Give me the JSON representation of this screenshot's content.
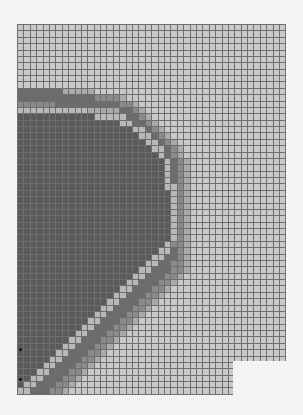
{
  "grid": {
    "left": 17,
    "top": 24,
    "cols": 42,
    "rows": 58,
    "cell_w": 6.4,
    "cell_h": 6.38,
    "palette": {
      "0": "#c9c9c9",
      "1": "#aaaaaa",
      "2": "#8a8a8a",
      "3": "#6b6b6b",
      "4": "#5a5a5a",
      "5": "#b8b8b8"
    },
    "line_color": "#6e6e6e",
    "rows_data": [
      "000000000000000000000000000000000000000000",
      "000000000000000000000000000000000000000000",
      "000000000000000000000000000000000000000000",
      "000000000000000000000000000000000000000000",
      "000000000000000000000000000000000000000000",
      "000000000000000000000000000000000000000000",
      "000000000000000000000000000000000000000000",
      "000000000000000000000000000000000000000000",
      "000000000000000000000000000000000000000000",
      "000000000000000000000000000000000000000000",
      "333333311111000000000000000000000000000000",
      "333333333333222210000000000000000000000000",
      "222222333333333322100000000000000000000000",
      "555555555551111133210000000000000000000000",
      "444444444444555553321000000000000000000000",
      "444444444444444455332100000000000000000000",
      "444444444444444444553210000000000000000000",
      "444444444444444444455321000000000000000000",
      "444444444444444444445532100000000000000000",
      "444444444444444444444553210000000000000000",
      "444444444444444444444453210000000000000000",
      "444444444444444444444445321000000000000000",
      "444444444444444444444445321000000000000000",
      "444444444444444444444445321000000000000000",
      "444444444444444444444445321000000000000000",
      "444444444444444444444445521000000000000000",
      "444444444444444444444444521000000000000000",
      "444444444444444444444444521000000000000000",
      "444444444444444444444444521000000000000000",
      "444444444444444444444444521000000000000000",
      "444444444444444444444444521000000000000000",
      "444444444444444444444444521000000000000000",
      "444444444444444444444444521000000000000000",
      "444444444444444444444444521000000000000000",
      "444444444444444444444445221000000000000000",
      "444444444444444444444455321000000000000000",
      "444444444444444444444553321000000000000000",
      "444444444444444444445533221000000000000000",
      "444444444444444444455333221000000000000000",
      "444444444444444444553332210000000000000000",
      "444444444444444445533322100000000000000000",
      "444444444444444455333221000000000000000000",
      "444444444444444553332210000000000000000000",
      "444444444444445533322100000000000000000000",
      "444444444444455333221000000000000000000000",
      "444444444444553332210000000000000000000000",
      "444444444445533322100000000000000000000000",
      "444444444455333221000000000000000000000000",
      "444444444553332210000000000000000000000000",
      "444444445533322100000000000000000000000000",
      "444444455333221000000000000000000000000000",
      "444444553332210000000000000000000000000000",
      "444445533322100000000000000000000000000000",
      "444455333221000000000000000000000000000000",
      "444553332210000000000000000000000000000000",
      "445533322100000000000000000000000000000000",
      "455333221000000000000000000000000000000000",
      "553332210000000000000000000000000000000000"
    ],
    "notch": {
      "x": 233,
      "y": 361,
      "w": 60,
      "h": 60
    },
    "markers": [
      {
        "x": 19,
        "y": 348
      },
      {
        "x": 19,
        "y": 378
      }
    ]
  }
}
